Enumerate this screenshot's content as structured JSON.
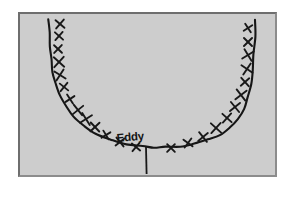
{
  "figure": {
    "background_color": "#ffffff",
    "panel_color": "#cdcdcd",
    "panel_border_color": "#6e6e6e",
    "ink_color": "#161616",
    "annotation_label": "Eddy"
  },
  "chart_data": {
    "type": "scatter",
    "title": "",
    "subtitle": "",
    "xlabel": "",
    "ylabel": "",
    "grid": false,
    "legend": null,
    "axis_visible": false,
    "xlim": [
      0,
      259
    ],
    "ylim": [
      0,
      165
    ],
    "annotations": [
      {
        "text": "Eddy",
        "x": 125,
        "y": 128,
        "tick_x": 126,
        "tick_y_top": 133,
        "tick_y_bottom": 160
      }
    ],
    "series": [
      {
        "name": "U-shaped boundary curve",
        "type": "line",
        "marker": "none",
        "x": [
          29,
          29,
          30,
          31,
          33,
          36,
          40,
          46,
          54,
          64,
          76,
          90,
          106,
          122,
          134,
          146,
          160,
          174,
          188,
          200,
          210,
          218,
          224,
          228,
          231,
          233,
          234,
          235,
          235
        ],
        "y": [
          5,
          18,
          32,
          45,
          58,
          70,
          82,
          93,
          103,
          112,
          120,
          126,
          130,
          132,
          133,
          133,
          132,
          130,
          126,
          121,
          114,
          105,
          95,
          83,
          70,
          56,
          40,
          23,
          5
        ]
      },
      {
        "name": "X data markers",
        "type": "scatter",
        "marker": "x",
        "x": [
          40,
          39,
          38,
          39,
          40,
          44,
          50,
          58,
          66,
          75,
          86,
          100,
          116,
          151,
          168,
          183,
          196,
          207,
          215,
          221,
          225,
          227,
          228,
          228,
          228
        ],
        "y": [
          10,
          22,
          35,
          48,
          61,
          73,
          85,
          96,
          105,
          113,
          121,
          128,
          133,
          134,
          129,
          123,
          114,
          104,
          93,
          81,
          68,
          55,
          41,
          28,
          14
        ]
      }
    ]
  }
}
